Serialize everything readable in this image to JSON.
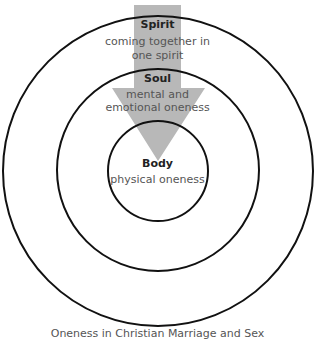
{
  "diagram": {
    "colors": {
      "arrow": "#b8b8b8",
      "circle_stroke": "#111111",
      "text": "#555555"
    },
    "levels": [
      {
        "title": "Spirit",
        "desc_lines": [
          "coming together in",
          "one spirit"
        ]
      },
      {
        "title": "Soul",
        "desc_lines": [
          "mental and",
          "emotional oneness"
        ]
      },
      {
        "title": "Body",
        "desc_lines": [
          "physical oneness"
        ]
      }
    ],
    "caption": "Oneness in Christian Marriage and Sex"
  }
}
